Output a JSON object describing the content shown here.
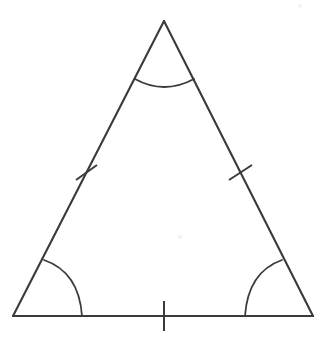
{
  "figure": {
    "shape_name": "triangle",
    "background_color": "#ffffff",
    "stroke_color": "#3a3a3a",
    "canvas": {
      "width": 325,
      "height": 337
    },
    "vertices": [
      {
        "name": "apex",
        "label": "",
        "x": 164,
        "y": 21
      },
      {
        "name": "bottom-left",
        "label": "",
        "x": 13,
        "y": 316
      },
      {
        "name": "bottom-right",
        "label": "",
        "x": 313,
        "y": 316
      }
    ],
    "sides": [
      {
        "name": "left-side",
        "from": "apex",
        "to": "bottom-left",
        "path": "M 164 21 L 13 316",
        "tick_count": 1
      },
      {
        "name": "right-side",
        "from": "apex",
        "to": "bottom-right",
        "path": "M 164 21 L 313 316",
        "tick_count": 1
      },
      {
        "name": "base-side",
        "from": "bottom-left",
        "to": "bottom-right",
        "path": "M 13 316 L 313 316",
        "tick_count": 1
      }
    ],
    "tick_marks": [
      {
        "name": "tick-left-side",
        "path": "M 76 180 L 97 165"
      },
      {
        "name": "tick-right-side",
        "path": "M 229 180 L 252 165"
      },
      {
        "name": "tick-base-side",
        "path": "M 164 301 L 164 331"
      }
    ],
    "angle_arcs": [
      {
        "name": "angle-arc-apex",
        "at_vertex": "apex",
        "label": "",
        "path": "M 135 79 Q 164 95 194 79"
      },
      {
        "name": "angle-arc-bottom-left",
        "at_vertex": "bottom-left",
        "label": "",
        "path": "M 44 260 Q 79 272 82 316"
      },
      {
        "name": "angle-arc-bottom-right",
        "at_vertex": "bottom-right",
        "label": "",
        "path": "M 282 260 Q 248 272 245 316"
      }
    ],
    "artifacts": [
      {
        "name": "scan-speck-center",
        "cx": 180,
        "cy": 237,
        "r": 2.2
      },
      {
        "name": "scan-speck-upper-right",
        "cx": 300,
        "cy": 6,
        "r": 2.0
      }
    ]
  }
}
